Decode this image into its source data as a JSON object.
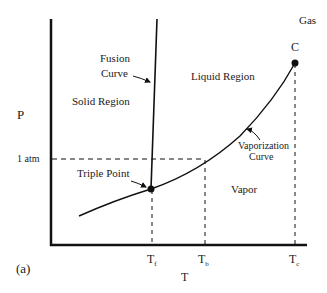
{
  "diagram": {
    "panel_label": "(a)",
    "axes": {
      "x_label": "T",
      "y_label": "P",
      "y_ticks": [
        {
          "label": "1 atm"
        }
      ],
      "x_ticks": [
        {
          "main": "T",
          "sub": "f"
        },
        {
          "main": "T",
          "sub": "b"
        },
        {
          "main": "T",
          "sub": "c"
        }
      ]
    },
    "regions": {
      "solid": "Solid Region",
      "liquid": "Liquid Region",
      "vapor": "Vapor",
      "gas": "Gas"
    },
    "curves": {
      "fusion_line1": "Fusion",
      "fusion_line2": "Curve",
      "vaporization_line1": "Vaporization",
      "vaporization_line2": "Curve"
    },
    "points": {
      "triple": "Triple Point",
      "critical": "C"
    },
    "colors": {
      "line": "#111111",
      "background": "#ffffff"
    }
  }
}
